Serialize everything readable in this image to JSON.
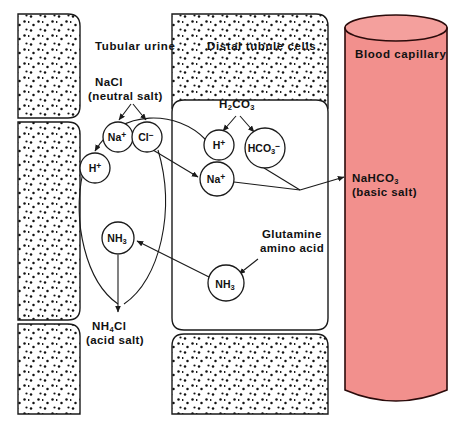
{
  "diagram": {
    "colors": {
      "capillary_fill": "#F2908D",
      "capillary_stroke": "#2B0B0B",
      "outline": "#1A1A1A",
      "background": "#FFFFFF"
    }
  },
  "compartments": [
    {
      "id": "tubular-urine",
      "label": "Tubular urine"
    },
    {
      "id": "distal-tubule-cells",
      "label": "Distal tubule cells"
    },
    {
      "id": "blood-capillary",
      "label": "Blood capillary"
    }
  ],
  "labels": {
    "nacl": "NaCl",
    "nacl_note": "(neutral salt)",
    "h2co3_main": "H",
    "h2co3_sub1": "2",
    "h2co3_mid": "CO",
    "h2co3_sub2": "3",
    "glutamine_line1": "Glutamine",
    "glutamine_line2": "amino acid",
    "nahco3_main": "NaHCO",
    "nahco3_sub": "3",
    "nahco3_note": "(basic salt)",
    "nh4cl_main": "NH",
    "nh4cl_sub": "4",
    "nh4cl_rest": "Cl",
    "nh4cl_note": "(acid salt)"
  },
  "species": [
    {
      "id": "h-urine",
      "base": "H",
      "sub": "",
      "sup": "+",
      "cx": 95,
      "cy": 168,
      "r": 15
    },
    {
      "id": "na-urine",
      "base": "Na",
      "sub": "",
      "sup": "+",
      "cx": 118,
      "cy": 137,
      "r": 15
    },
    {
      "id": "cl-urine",
      "base": "Cl",
      "sub": "",
      "sup": "−",
      "cx": 147,
      "cy": 137,
      "r": 15
    },
    {
      "id": "nh3-urine",
      "base": "NH",
      "sub": "3",
      "sup": "",
      "cx": 118,
      "cy": 238,
      "r": 16
    },
    {
      "id": "h-cell",
      "base": "H",
      "sub": "",
      "sup": "+",
      "cx": 219,
      "cy": 145,
      "r": 15
    },
    {
      "id": "hco3-cell",
      "base": "HCO",
      "sub": "3",
      "sup": "−",
      "cx": 265,
      "cy": 148,
      "r": 20
    },
    {
      "id": "na-cell",
      "base": "Na",
      "sub": "",
      "sup": "+",
      "cx": 217,
      "cy": 179,
      "r": 17
    },
    {
      "id": "nh3-cell",
      "base": "NH",
      "sub": "3",
      "sup": "",
      "cx": 226,
      "cy": 283,
      "r": 18
    }
  ],
  "reactions": [
    {
      "id": "nacl-dissociation",
      "from": "NaCl",
      "to": [
        "Na+",
        "Cl-"
      ]
    },
    {
      "id": "h2co3-dissociation",
      "from": "H2CO3",
      "to": [
        "H+",
        "HCO3-"
      ]
    },
    {
      "id": "h-secretion",
      "from": "H+ (cell)",
      "to": "H+ (urine)"
    },
    {
      "id": "na-reabsorption",
      "from": "Na+ (urine)",
      "to": "Na+ (cell)"
    },
    {
      "id": "nahco3-to-blood",
      "from": "Na+ + HCO3- (cell)",
      "to": "NaHCO3 (blood)"
    },
    {
      "id": "nh3-secretion",
      "from": "NH3 (cell)",
      "to": "NH3 (urine)"
    },
    {
      "id": "nh4cl-formation",
      "from": "NH3 + Cl- (urine)",
      "to": "NH4Cl"
    }
  ]
}
